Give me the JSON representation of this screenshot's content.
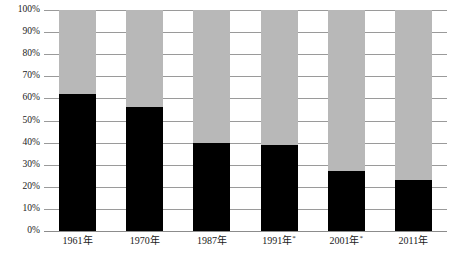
{
  "chart_data": {
    "type": "bar",
    "stacked": true,
    "title": "",
    "subtitle": "",
    "xlabel": "",
    "ylabel": "",
    "categories": [
      "1961年",
      "1970年",
      "1987年*",
      "1991年*",
      "2001年*",
      "2011年"
    ],
    "category_labels": [
      {
        "text": "1961年",
        "asterisk": false
      },
      {
        "text": "1970年",
        "asterisk": false
      },
      {
        "text": "1987年",
        "asterisk": false
      },
      {
        "text": "1991年",
        "asterisk": true
      },
      {
        "text": "2001年",
        "asterisk": true
      },
      {
        "text": "2011年",
        "asterisk": false
      }
    ],
    "series": [
      {
        "name": "lower-segment",
        "color": "#000000",
        "values": [
          62,
          56,
          40,
          39,
          27,
          23
        ]
      },
      {
        "name": "upper-segment",
        "color": "#b8b8b8",
        "values": [
          38,
          44,
          60,
          61,
          73,
          77
        ]
      }
    ],
    "ylim": [
      0,
      100
    ],
    "y_ticks": [
      0,
      10,
      20,
      30,
      40,
      50,
      60,
      70,
      80,
      90,
      100
    ],
    "y_tick_labels": [
      "0%",
      "10%",
      "20%",
      "30%",
      "40%",
      "50%",
      "60%",
      "70%",
      "80%",
      "90%",
      "100%"
    ],
    "grid": true,
    "legend": "none",
    "unit": "%"
  },
  "colors": {
    "lower_segment": "#000000",
    "upper_segment": "#b8b8b8",
    "gridline": "#9a9a9a",
    "text": "#1a1a1a",
    "background": "#ffffff"
  }
}
